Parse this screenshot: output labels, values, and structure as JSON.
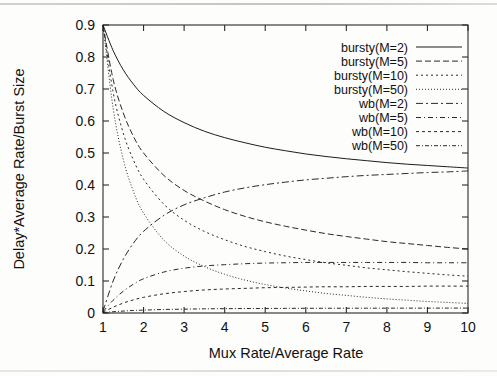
{
  "figure": {
    "type": "line-chart",
    "background": "#fdfdfc",
    "ink_color": "#1d1d1d"
  },
  "axes": {
    "x_title": "Mux Rate/Average Rate",
    "y_title": "Delay*Average Rate/Burst Size",
    "x_ticks": [
      "1",
      "2",
      "3",
      "4",
      "5",
      "6",
      "7",
      "8",
      "9",
      "10"
    ],
    "y_ticks": [
      "0",
      "0.1",
      "0.2",
      "0.3",
      "0.4",
      "0.5",
      "0.6",
      "0.7",
      "0.8",
      "0.9"
    ]
  },
  "legend": {
    "position": "top-right-inside",
    "entries": [
      {
        "label": "bursty(M=2)",
        "dash": "none"
      },
      {
        "label": "bursty(M=5)",
        "dash": "6,3"
      },
      {
        "label": "bursty(M=10)",
        "dash": "2,3"
      },
      {
        "label": "bursty(M=50)",
        "dash": "1,2"
      },
      {
        "label": "wb(M=2)",
        "dash": "7,3,2,3"
      },
      {
        "label": "wb(M=5)",
        "dash": "5,3,1,3"
      },
      {
        "label": "wb(M=10)",
        "dash": "3,3"
      },
      {
        "label": "wb(M=50)",
        "dash": "4,2,1,2"
      }
    ]
  },
  "chart_data": {
    "type": "line",
    "title": "",
    "xlabel": "Mux Rate/Average Rate",
    "ylabel": "Delay*Average Rate/Burst Size",
    "xlim": [
      1,
      10
    ],
    "ylim": [
      0,
      0.9
    ],
    "grid": false,
    "legend_position": "top-right-inside",
    "x": [
      1,
      1.25,
      1.5,
      1.75,
      2,
      2.5,
      3,
      3.5,
      4,
      4.5,
      5,
      5.5,
      6,
      6.5,
      7,
      7.5,
      8,
      8.5,
      9,
      9.5,
      10
    ],
    "series": [
      {
        "name": "bursty(M=2)",
        "dash": "none",
        "values": [
          0.9,
          0.82,
          0.76,
          0.715,
          0.68,
          0.63,
          0.595,
          0.568,
          0.548,
          0.532,
          0.518,
          0.507,
          0.497,
          0.489,
          0.482,
          0.476,
          0.47,
          0.465,
          0.461,
          0.457,
          0.453
        ]
      },
      {
        "name": "bursty(M=5)",
        "dash": "6,3",
        "values": [
          0.9,
          0.73,
          0.625,
          0.552,
          0.5,
          0.43,
          0.383,
          0.35,
          0.323,
          0.302,
          0.285,
          0.271,
          0.259,
          0.248,
          0.239,
          0.231,
          0.223,
          0.217,
          0.211,
          0.205,
          0.2
        ]
      },
      {
        "name": "bursty(M=10)",
        "dash": "2,3",
        "values": [
          0.9,
          0.69,
          0.562,
          0.478,
          0.418,
          0.34,
          0.29,
          0.255,
          0.229,
          0.208,
          0.192,
          0.178,
          0.167,
          0.157,
          0.149,
          0.141,
          0.135,
          0.129,
          0.124,
          0.119,
          0.115
        ]
      },
      {
        "name": "bursty(M=50)",
        "dash": "1,2",
        "values": [
          0.9,
          0.64,
          0.48,
          0.38,
          0.312,
          0.228,
          0.178,
          0.145,
          0.121,
          0.103,
          0.089,
          0.078,
          0.069,
          0.061,
          0.055,
          0.049,
          0.044,
          0.04,
          0.036,
          0.033,
          0.03
        ]
      },
      {
        "name": "wb(M=2)",
        "dash": "7,3,2,3",
        "values": [
          0.005,
          0.1,
          0.168,
          0.218,
          0.255,
          0.305,
          0.338,
          0.36,
          0.378,
          0.391,
          0.401,
          0.409,
          0.416,
          0.421,
          0.426,
          0.43,
          0.433,
          0.436,
          0.439,
          0.441,
          0.444
        ]
      },
      {
        "name": "wb(M=5)",
        "dash": "5,3,1,3",
        "values": [
          0.004,
          0.04,
          0.068,
          0.09,
          0.107,
          0.128,
          0.14,
          0.147,
          0.151,
          0.154,
          0.156,
          0.157,
          0.158,
          0.158,
          0.158,
          0.158,
          0.158,
          0.158,
          0.157,
          0.157,
          0.157
        ]
      },
      {
        "name": "wb(M=10)",
        "dash": "3,3",
        "values": [
          0.003,
          0.018,
          0.031,
          0.041,
          0.049,
          0.06,
          0.067,
          0.072,
          0.075,
          0.077,
          0.079,
          0.08,
          0.081,
          0.082,
          0.082,
          0.083,
          0.083,
          0.083,
          0.084,
          0.084,
          0.084
        ]
      },
      {
        "name": "wb(M=50)",
        "dash": "4,2,1,2",
        "values": [
          0.001,
          0.004,
          0.006,
          0.008,
          0.009,
          0.011,
          0.012,
          0.013,
          0.0135,
          0.014,
          0.0142,
          0.0145,
          0.0147,
          0.0148,
          0.0149,
          0.015,
          0.0151,
          0.0152,
          0.0152,
          0.0153,
          0.0153
        ]
      }
    ]
  }
}
